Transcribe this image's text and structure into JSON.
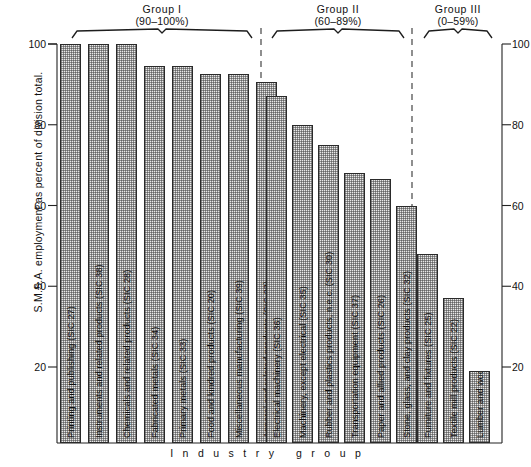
{
  "chart_data": {
    "type": "bar",
    "title": "",
    "xlabel": "I n d u s t r y   g r o u p",
    "ylabel": "S.M.S.A. employment as percent of division total.",
    "ylim": [
      14,
      100
    ],
    "yticks": [
      20,
      40,
      60,
      80,
      100
    ],
    "ytick_labels": [
      "20",
      "40",
      "60",
      "80",
      "100"
    ],
    "grid": false,
    "legend": "none",
    "dual_axis": true,
    "categories": [
      "Printing and publishing (SIC 27)",
      "Instruments and related products (SIC 38)",
      "Chemicals and related products (SIC 28)",
      "Fabricated metals (SIC 34)",
      "Primary metals (SIC 33)",
      "Food and kindred products (SIC 20)",
      "Miscellaneous manufacturing (SIC 39)",
      "Apparel and related products (SIC 23)",
      "Electrical machinery (SIC 36)",
      "Machinery, except electrical (SIC 35)",
      "Rubber and plastics products, n.e.c. (SIC 30)",
      "Transportation equipment (SIC 37)",
      "Paper and allied products (SIC 26)",
      "Stone, glass, and clay products (SIC 32)",
      "Furniture and fixtures (SIC 25)",
      "Textile mill products (SIC 22)",
      "Lumber and wood products (SIC 24)"
    ],
    "values": [
      100,
      100,
      100,
      94.5,
      94.5,
      92.5,
      92.5,
      90.5,
      87,
      80,
      75,
      68,
      66.5,
      60,
      48,
      37,
      19
    ],
    "groups": [
      {
        "name": "Group I",
        "range": "(90–100%)",
        "members": 8
      },
      {
        "name": "Group II",
        "range": "(60–89%)",
        "members": 6
      },
      {
        "name": "Group III",
        "range": "(0–59%)",
        "members": 3
      }
    ]
  },
  "axis": {
    "left_ticks": [
      "100",
      "80",
      "60",
      "40",
      "20"
    ],
    "right_ticks": [
      "100",
      "80",
      "60",
      "40",
      "20"
    ]
  },
  "groups": {
    "g1_name": "Group I",
    "g1_range": "(90–100%)",
    "g2_name": "Group II",
    "g2_range": "(60–89%)",
    "g3_name": "Group III",
    "g3_range": "(0–59%)"
  },
  "bars": [
    {
      "label": "Printing and publishing (SIC 27)",
      "value": 100
    },
    {
      "label": "Instruments and related products (SIC 38)",
      "value": 100
    },
    {
      "label": "Chemicals and related products (SIC 28)",
      "value": 100
    },
    {
      "label": "Fabricated metals (SIC 34)",
      "value": 94.5
    },
    {
      "label": "Primary metals (SIC 33)",
      "value": 94.5
    },
    {
      "label": "Food and kindred products (SIC 20)",
      "value": 92.5
    },
    {
      "label": "Miscellaneous manufacturing (SIC 39)",
      "value": 92.5
    },
    {
      "label": "Apparel and related products (SIC 23)",
      "value": 90.5
    },
    {
      "label": "Electrical machinery (SIC 36)",
      "value": 87
    },
    {
      "label": "Machinery, except electrical (SIC 35)",
      "value": 80
    },
    {
      "label": "Rubber and plastics products, n.e.c. (SIC 30)",
      "value": 75
    },
    {
      "label": "Transportation equipment (SIC 37)",
      "value": 68
    },
    {
      "label": "Paper and allied products (SIC 26)",
      "value": 66.5
    },
    {
      "label": "Stone, glass, and clay products (SIC 32)",
      "value": 60
    },
    {
      "label": "Furniture and fixtures (SIC 25)",
      "value": 48
    },
    {
      "label": "Textile mill products (SIC 22)",
      "value": 37
    },
    {
      "label": "Lumber and wood products (SIC 24)",
      "value": 19
    }
  ],
  "captions": {
    "y_axis": "S.M.S.A. employment as percent of division total.",
    "x_axis": "Industry group"
  }
}
